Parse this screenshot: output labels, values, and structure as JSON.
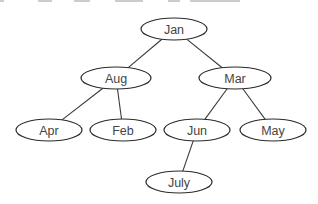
{
  "diagram": {
    "type": "binary-search-tree",
    "colors": {
      "stroke": "#2a2a2a",
      "edge": "#3a3a3a",
      "text": "#444444",
      "background": "#ffffff"
    },
    "nodes": [
      {
        "id": "jan",
        "label": "Jan",
        "cx": 174,
        "cy": 29,
        "rx": 33,
        "ry": 11
      },
      {
        "id": "aug",
        "label": "Aug",
        "cx": 116,
        "cy": 78,
        "rx": 35,
        "ry": 11
      },
      {
        "id": "mar",
        "label": "Mar",
        "cx": 235,
        "cy": 78,
        "rx": 36,
        "ry": 11
      },
      {
        "id": "apr",
        "label": "Apr",
        "cx": 49,
        "cy": 130,
        "rx": 33,
        "ry": 11
      },
      {
        "id": "feb",
        "label": "Feb",
        "cx": 123,
        "cy": 130,
        "rx": 33,
        "ry": 11
      },
      {
        "id": "jun",
        "label": "Jun",
        "cx": 197,
        "cy": 130,
        "rx": 33,
        "ry": 11
      },
      {
        "id": "may",
        "label": "May",
        "cx": 273,
        "cy": 130,
        "rx": 33,
        "ry": 11
      },
      {
        "id": "july",
        "label": "July",
        "cx": 179,
        "cy": 182,
        "rx": 33,
        "ry": 11
      }
    ],
    "edges": [
      {
        "from": "jan",
        "to": "aug"
      },
      {
        "from": "jan",
        "to": "mar"
      },
      {
        "from": "aug",
        "to": "apr"
      },
      {
        "from": "aug",
        "to": "feb"
      },
      {
        "from": "mar",
        "to": "jun"
      },
      {
        "from": "mar",
        "to": "may"
      },
      {
        "from": "jun",
        "to": "july"
      }
    ]
  }
}
